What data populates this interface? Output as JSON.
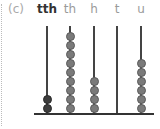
{
  "question_label": "(c)",
  "columns": [
    {
      "label": "tth",
      "beads": 2,
      "dark": true
    },
    {
      "label": "th",
      "beads": 9,
      "dark": false
    },
    {
      "label": "h",
      "beads": 4,
      "dark": false
    },
    {
      "label": "t",
      "beads": 0,
      "dark": false
    },
    {
      "label": "u",
      "beads": 6,
      "dark": false
    }
  ],
  "colors": {
    "bead": "#7a7a7a",
    "bead_dark": "#3d3d3d",
    "rod": "#444444"
  }
}
